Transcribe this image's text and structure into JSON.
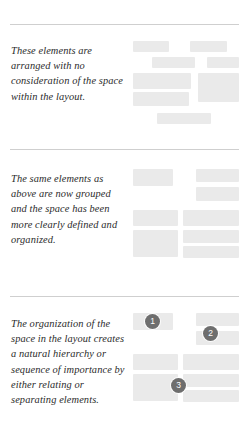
{
  "page": {
    "background_color": "#ffffff",
    "rule_color": "#cfcfcf",
    "block_color": "#eaeaea",
    "badge_color": "#6e6e6e",
    "text_color": "#2b2b2b"
  },
  "sections": [
    {
      "id": "ungrouped",
      "caption": "These elements are arranged with no consideration of the space within the layout.",
      "blocks": [
        {
          "x": 0,
          "y": 17,
          "w": 36,
          "h": 11
        },
        {
          "x": 57,
          "y": 17,
          "w": 37,
          "h": 11
        },
        {
          "x": 19,
          "y": 33,
          "w": 43,
          "h": 11
        },
        {
          "x": 74,
          "y": 33,
          "w": 32,
          "h": 11
        },
        {
          "x": 0,
          "y": 49,
          "w": 58,
          "h": 16
        },
        {
          "x": 65,
          "y": 49,
          "w": 41,
          "h": 29
        },
        {
          "x": 0,
          "y": 68,
          "w": 56,
          "h": 14
        },
        {
          "x": 24,
          "y": 89,
          "w": 54,
          "h": 11
        }
      ],
      "badges": []
    },
    {
      "id": "grouped",
      "caption": "The same elements as above are now grouped and the space has been more clearly defined and organized.",
      "blocks": [
        {
          "x": 0,
          "y": 20,
          "w": 40,
          "h": 17
        },
        {
          "x": 63,
          "y": 20,
          "w": 43,
          "h": 13
        },
        {
          "x": 63,
          "y": 38,
          "w": 43,
          "h": 14
        },
        {
          "x": 0,
          "y": 61,
          "w": 45,
          "h": 16
        },
        {
          "x": 50,
          "y": 61,
          "w": 56,
          "h": 16
        },
        {
          "x": 0,
          "y": 81,
          "w": 45,
          "h": 27
        },
        {
          "x": 50,
          "y": 81,
          "w": 56,
          "h": 13
        },
        {
          "x": 50,
          "y": 97,
          "w": 56,
          "h": 12
        }
      ],
      "badges": []
    },
    {
      "id": "hierarchy",
      "caption": "The organization of the space in the layout creates a natural hierarchy or sequence of importance by either relating or separating elements.",
      "blocks": [
        {
          "x": 0,
          "y": 17,
          "w": 40,
          "h": 17
        },
        {
          "x": 63,
          "y": 17,
          "w": 43,
          "h": 13
        },
        {
          "x": 63,
          "y": 35,
          "w": 43,
          "h": 14
        },
        {
          "x": 0,
          "y": 58,
          "w": 45,
          "h": 16
        },
        {
          "x": 50,
          "y": 58,
          "w": 56,
          "h": 16
        },
        {
          "x": 0,
          "y": 78,
          "w": 45,
          "h": 27
        },
        {
          "x": 50,
          "y": 78,
          "w": 56,
          "h": 13
        },
        {
          "x": 50,
          "y": 94,
          "w": 56,
          "h": 12
        }
      ],
      "badges": [
        {
          "label": "1",
          "x": 12,
          "y": 18
        },
        {
          "label": "2",
          "x": 70,
          "y": 30
        },
        {
          "label": "3",
          "x": 38,
          "y": 82
        }
      ]
    }
  ]
}
